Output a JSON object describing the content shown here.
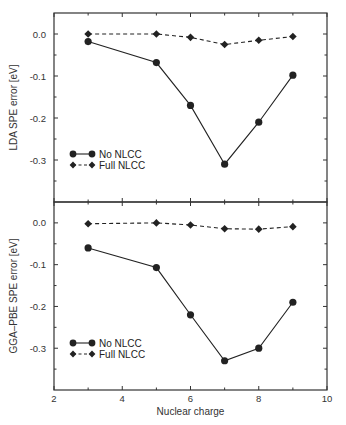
{
  "chart_data": [
    {
      "type": "line",
      "panel": "top",
      "title": "",
      "xlabel": "",
      "ylabel": "LDA SPE error [eV]",
      "xlim": [
        2,
        10
      ],
      "ylim": [
        -0.4,
        0.05
      ],
      "yticks": [
        "0.0",
        "-0.1",
        "-0.2",
        "-0.3"
      ],
      "ytick_values": [
        0.0,
        -0.1,
        -0.2,
        -0.3
      ],
      "x": [
        3,
        5,
        6,
        7,
        8,
        9
      ],
      "series": [
        {
          "name": "No NLCC",
          "style": "solid",
          "marker": "circle",
          "values": [
            -0.018,
            -0.068,
            -0.17,
            -0.31,
            -0.21,
            -0.098
          ]
        },
        {
          "name": "Full NLCC",
          "style": "dashed",
          "marker": "diamond",
          "values": [
            0.0,
            0.0,
            -0.008,
            -0.025,
            -0.015,
            -0.006
          ]
        }
      ],
      "legend_position": "lower left",
      "grid": false
    },
    {
      "type": "line",
      "panel": "bottom",
      "title": "",
      "xlabel": "Nuclear charge",
      "ylabel": "GGA–PBE SPE error [eV]",
      "xlim": [
        2,
        10
      ],
      "ylim": [
        -0.4,
        0.05
      ],
      "xticks": [
        "2",
        "4",
        "6",
        "8",
        "10"
      ],
      "xtick_values": [
        2,
        4,
        6,
        8,
        10
      ],
      "yticks": [
        "0.0",
        "-0.1",
        "-0.2",
        "-0.3"
      ],
      "ytick_values": [
        0.0,
        -0.1,
        -0.2,
        -0.3
      ],
      "x": [
        3,
        5,
        6,
        7,
        8,
        9
      ],
      "series": [
        {
          "name": "No NLCC",
          "style": "solid",
          "marker": "circle",
          "values": [
            -0.06,
            -0.107,
            -0.22,
            -0.33,
            -0.3,
            -0.19
          ]
        },
        {
          "name": "Full NLCC",
          "style": "dashed",
          "marker": "diamond",
          "values": [
            -0.002,
            0.0,
            -0.005,
            -0.014,
            -0.015,
            -0.009
          ]
        }
      ],
      "legend_position": "lower left",
      "grid": false
    }
  ],
  "labels": {
    "top_ylabel": "LDA SPE error [eV]",
    "bottom_ylabel": "GGA–PBE SPE error [eV]",
    "xlabel": "Nuclear charge",
    "legend_no": "No NLCC",
    "legend_full": "Full NLCC"
  },
  "colors": {
    "line": "#222222",
    "axis": "#333333"
  }
}
